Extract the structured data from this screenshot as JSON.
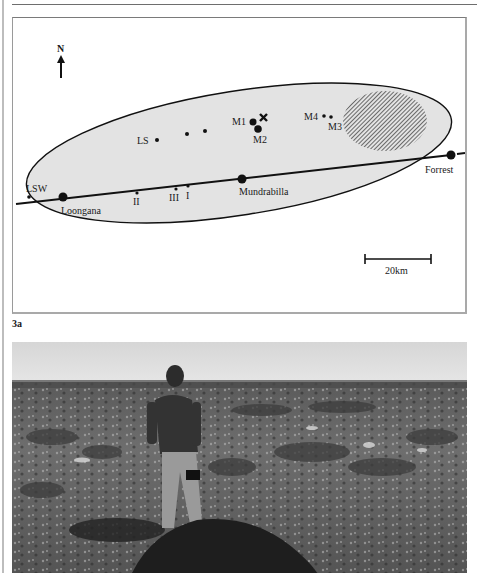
{
  "figure": {
    "label": "3a"
  },
  "map": {
    "north_label": "N",
    "scale_bar_label": "20km",
    "places": {
      "lsw": "LSW",
      "loongana": "Loongana",
      "ii": "II",
      "iii": "III",
      "i": "I",
      "mundrabilla": "Mundrabilla",
      "forrest": "Forrest",
      "ls": "LS",
      "m1": "M1",
      "m2": "M2",
      "m3": "M3",
      "m4": "M4"
    },
    "colors": {
      "ellipse_fill": "#e3e3e3",
      "line": "#111111"
    }
  },
  "photo": {
    "description": "Black and white photograph of a man standing in a flat, shrub-covered plain beside a dark mound of vegetation"
  }
}
